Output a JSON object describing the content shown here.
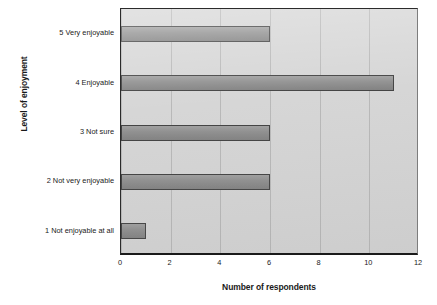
{
  "chart_data": {
    "type": "bar",
    "orientation": "horizontal",
    "title": "",
    "xlabel": "Number of respondents",
    "ylabel": "Level of enjoyment",
    "categories": [
      "1 Not enjoyable at all",
      "2 Not very enjoyable",
      "3 Not sure",
      "4 Enjoyable",
      "5 Very enjoyable"
    ],
    "values": [
      1,
      6,
      6,
      11,
      6
    ],
    "xlim": [
      0,
      12
    ],
    "xticks": [
      0,
      2,
      4,
      6,
      8,
      10,
      12
    ],
    "xtick_labels": [
      "0",
      "2",
      "4",
      "6",
      "8",
      "10",
      "12"
    ],
    "grid": true,
    "legend": false,
    "colors": {
      "bar_fill": "#8a8a8a",
      "bar_border": "#3a3a3a",
      "plot_background": "#d4d4d4",
      "axis": "#1a1a1a",
      "gridline": "#969696",
      "page_background": "#ffffff"
    }
  }
}
